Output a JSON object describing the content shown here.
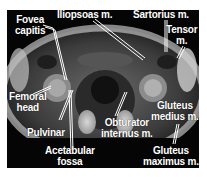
{
  "figure": {
    "type": "axial MRI, hip/pelvis",
    "labels": {
      "fovea_capitis": "Fovea\ncapitis",
      "iliopsoas": "Iliopsoas m.",
      "sartorius": "Sartorius m.",
      "tensor": "Tensor\nm.",
      "femoral_head": "Femoral\nhead",
      "gluteus_medius": "Gluteus\nmedius m.",
      "pulvinar": "Pulvinar",
      "obturator_internus": "Obturator\ninternus m.",
      "acetabular_fossa": "Acetabular\nfossa",
      "gluteus_maximus": "Gluteus\nmaximus m."
    },
    "colors": {
      "background": "#050505",
      "label": "#ffffff",
      "page": "#ffffff"
    }
  }
}
